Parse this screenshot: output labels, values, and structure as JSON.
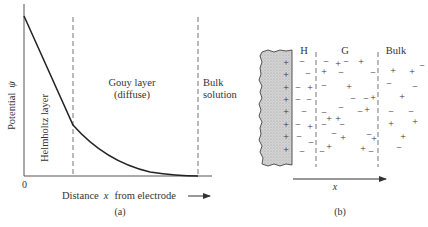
{
  "panel_a": {
    "y_axis_label": "Potential",
    "y_axis_symbol": "ψ",
    "origin_label": "0",
    "x_axis_label": "Distance",
    "x_axis_symbol": "x",
    "x_axis_label_suffix": "from electrode",
    "region_helmholtz": "Helmholtz layer",
    "region_gouy_line1": "Gouy layer",
    "region_gouy_line2": "(diffuse)",
    "region_bulk_line1": "Bulk",
    "region_bulk_line2": "solution",
    "caption": "(a)"
  },
  "panel_b": {
    "label_h": "H",
    "label_g": "G",
    "label_bulk": "Bulk",
    "axis_symbol": "x",
    "caption": "(b)",
    "electrode_charge": "+",
    "ion_plus": "+",
    "ion_minus": "−"
  },
  "colors": {
    "ink": "#333333",
    "electrode_fill": "#c8c8c8",
    "dash": "#666666"
  }
}
